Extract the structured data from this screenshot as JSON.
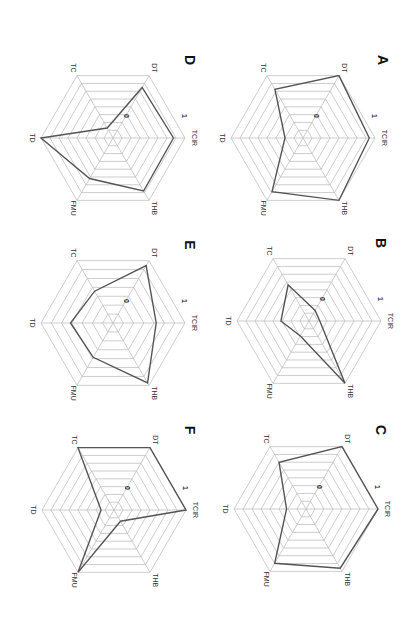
{
  "chart_data": {
    "type": "radar",
    "orientation": "rotated 90 degrees clockwise",
    "axes": [
      "TCIR",
      "THB",
      "FMU",
      "TD",
      "TC",
      "DT"
    ],
    "range": [
      0,
      1
    ],
    "tick_labels": {
      "min": "0",
      "max": "1"
    },
    "panels": [
      {
        "label": "A",
        "values": {
          "TCIR": 0.92,
          "THB": 1.0,
          "FMU": 0.86,
          "TD": 0.25,
          "TC": 0.78,
          "DT": 1.0
        }
      },
      {
        "label": "B",
        "values": {
          "TCIR": 0.15,
          "THB": 1.0,
          "FMU": 0.24,
          "TD": 0.39,
          "TC": 0.58,
          "DT": 0.17
        }
      },
      {
        "label": "C",
        "values": {
          "TCIR": 1.0,
          "THB": 0.95,
          "FMU": 0.87,
          "TD": 0.27,
          "TC": 0.75,
          "DT": 1.0
        }
      },
      {
        "label": "D",
        "values": {
          "TCIR": 0.84,
          "THB": 0.85,
          "FMU": 0.65,
          "TD": 1.0,
          "TC": 0.16,
          "DT": 0.81
        }
      },
      {
        "label": "E",
        "values": {
          "TCIR": 0.6,
          "THB": 0.96,
          "FMU": 0.55,
          "TD": 0.59,
          "TC": 0.51,
          "DT": 0.92
        }
      },
      {
        "label": "F",
        "values": {
          "TCIR": 1.0,
          "THB": 0.18,
          "FMU": 1.0,
          "TD": 0.18,
          "TC": 1.0,
          "DT": 1.0
        }
      }
    ],
    "grid": true,
    "legend": null,
    "title": ""
  },
  "layout": {
    "panels": [
      {
        "cx": 303,
        "cy": 138,
        "rings": 8,
        "letter_x": 382,
        "letter_y": 60
      },
      {
        "cx": 309,
        "cy": 321,
        "rings": 8,
        "letter_x": 380,
        "letter_y": 243
      },
      {
        "cx": 306,
        "cy": 509,
        "rings": 8,
        "letter_x": 380,
        "letter_y": 430
      },
      {
        "cx": 113,
        "cy": 138,
        "rings": 8,
        "letter_x": 189,
        "letter_y": 60
      },
      {
        "cx": 113,
        "cy": 323,
        "rings": 7,
        "letter_x": 189,
        "letter_y": 245
      },
      {
        "cx": 114,
        "cy": 510,
        "rings": 8,
        "letter_x": 189,
        "letter_y": 430
      }
    ],
    "radius": 72,
    "series_color": "#555555",
    "grid_color": "#b8b8b8"
  }
}
